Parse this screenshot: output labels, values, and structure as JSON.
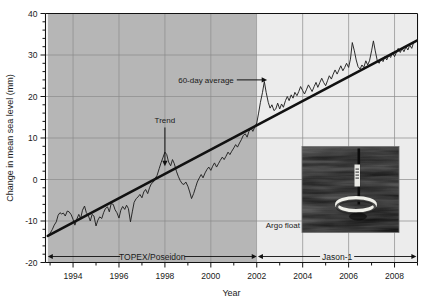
{
  "chart_data": {
    "type": "line",
    "title": "",
    "xlabel": "Year",
    "ylabel": "Change in mean sea level (mm)",
    "xlim": [
      1992.8,
      2009.0
    ],
    "ylim": [
      -20,
      40
    ],
    "xticks": [
      1994,
      1996,
      1998,
      2000,
      2002,
      2004,
      2006,
      2008
    ],
    "xticklabels": [
      "1994",
      "1996",
      "1998",
      "2000",
      "2002",
      "2004",
      "2006",
      "2008"
    ],
    "yticks": [
      -20,
      -10,
      0,
      10,
      20,
      30,
      40
    ],
    "yticklabels": [
      "-20",
      "-10",
      "0",
      "10",
      "20",
      "30",
      "40"
    ],
    "minor_xtick_interval": 1,
    "minor_ytick_interval": 2,
    "grid": true,
    "legend": "none",
    "annotations": [
      {
        "name": "sixty-day-average",
        "text": "60-day average",
        "x": 2001.0,
        "y": 24.0
      },
      {
        "name": "trend",
        "text": "Trend",
        "x": 1998.0,
        "y": 13.5
      },
      {
        "name": "argo-float",
        "text": "Argo float",
        "x": 2003.2,
        "y": -11.0
      }
    ],
    "period_bands": [
      {
        "name": "topex-poseidon",
        "label": "TOPEX/Poseidon",
        "start": 1992.9,
        "end": 2002.0,
        "shade": "#b6b6b6"
      },
      {
        "name": "jason-1",
        "label": "Jason-1",
        "start": 2002.05,
        "end": 2008.95,
        "shade": "#ececec"
      }
    ],
    "trend_line": {
      "name": "linear-trend",
      "points": [
        [
          1992.9,
          -13.6
        ],
        [
          2008.95,
          33.4
        ]
      ],
      "slope_mm_per_year": 2.93,
      "color": "#111111"
    },
    "series": [
      {
        "name": "60-day average sea level",
        "color": "#222222",
        "x": [
          1992.9,
          1993.0,
          1993.1,
          1993.18,
          1993.27,
          1993.35,
          1993.43,
          1993.5,
          1993.58,
          1993.66,
          1993.75,
          1993.83,
          1993.92,
          1994.0,
          1994.08,
          1994.16,
          1994.25,
          1994.33,
          1994.41,
          1994.5,
          1994.58,
          1994.66,
          1994.75,
          1994.83,
          1994.91,
          1995.0,
          1995.08,
          1995.16,
          1995.25,
          1995.33,
          1995.41,
          1995.5,
          1995.58,
          1995.66,
          1995.75,
          1995.83,
          1995.91,
          1996.0,
          1996.08,
          1996.16,
          1996.25,
          1996.33,
          1996.41,
          1996.5,
          1996.58,
          1996.66,
          1996.75,
          1996.83,
          1996.91,
          1997.0,
          1997.08,
          1997.16,
          1997.25,
          1997.33,
          1997.41,
          1997.5,
          1997.58,
          1997.66,
          1997.75,
          1997.83,
          1997.91,
          1998.0,
          1998.08,
          1998.16,
          1998.25,
          1998.33,
          1998.41,
          1998.5,
          1998.58,
          1998.66,
          1998.75,
          1998.83,
          1998.91,
          1999.0,
          1999.08,
          1999.16,
          1999.25,
          1999.33,
          1999.41,
          1999.5,
          1999.58,
          1999.66,
          1999.75,
          1999.83,
          1999.91,
          2000.0,
          2000.08,
          2000.16,
          2000.25,
          2000.33,
          2000.41,
          2000.5,
          2000.58,
          2000.66,
          2000.75,
          2000.83,
          2000.91,
          2001.0,
          2001.08,
          2001.16,
          2001.25,
          2001.33,
          2001.41,
          2001.5,
          2001.58,
          2001.66,
          2001.75,
          2001.83,
          2001.91,
          2002.0,
          2002.08,
          2002.16,
          2002.25,
          2002.33,
          2002.41,
          2002.5,
          2002.58,
          2002.66,
          2002.75,
          2002.83,
          2002.91,
          2003.0,
          2003.08,
          2003.16,
          2003.25,
          2003.33,
          2003.41,
          2003.5,
          2003.58,
          2003.66,
          2003.75,
          2003.83,
          2003.91,
          2004.0,
          2004.08,
          2004.16,
          2004.25,
          2004.33,
          2004.41,
          2004.5,
          2004.58,
          2004.66,
          2004.75,
          2004.83,
          2004.91,
          2005.0,
          2005.08,
          2005.16,
          2005.25,
          2005.33,
          2005.41,
          2005.5,
          2005.58,
          2005.66,
          2005.75,
          2005.83,
          2005.91,
          2006.0,
          2006.08,
          2006.16,
          2006.25,
          2006.33,
          2006.41,
          2006.5,
          2006.58,
          2006.66,
          2006.75,
          2006.83,
          2006.91,
          2007.0,
          2007.08,
          2007.16,
          2007.25,
          2007.33,
          2007.41,
          2007.5,
          2007.58,
          2007.66,
          2007.75,
          2007.83,
          2007.91,
          2008.0,
          2008.08,
          2008.16,
          2008.25,
          2008.33,
          2008.41,
          2008.5,
          2008.58,
          2008.66,
          2008.75,
          2008.83,
          2008.95
        ],
        "y": [
          -13.5,
          -13.0,
          -12.0,
          -11.0,
          -10.2,
          -8.6,
          -8.0,
          -8.3,
          -8.1,
          -8.8,
          -7.6,
          -7.8,
          -8.5,
          -9.6,
          -11.0,
          -9.6,
          -8.4,
          -9.4,
          -7.4,
          -6.4,
          -8.0,
          -8.6,
          -10.0,
          -8.4,
          -8.8,
          -11.2,
          -9.8,
          -9.0,
          -9.4,
          -8.0,
          -7.0,
          -6.6,
          -7.8,
          -5.8,
          -6.0,
          -7.3,
          -8.0,
          -9.3,
          -7.4,
          -6.5,
          -7.2,
          -6.2,
          -7.0,
          -10.2,
          -7.8,
          -5.5,
          -4.6,
          -4.2,
          -3.6,
          -4.4,
          -3.0,
          -2.4,
          -3.4,
          -2.0,
          -1.0,
          -0.6,
          0.3,
          1.0,
          2.6,
          4.0,
          5.2,
          6.6,
          6.0,
          4.2,
          3.3,
          4.8,
          3.8,
          2.0,
          0.8,
          -0.2,
          -1.0,
          -1.2,
          -0.6,
          -1.6,
          -3.0,
          -4.6,
          -3.4,
          -2.0,
          -0.6,
          0.4,
          1.2,
          0.4,
          1.6,
          2.4,
          3.0,
          2.2,
          3.2,
          4.0,
          3.0,
          3.8,
          4.6,
          5.4,
          4.8,
          5.6,
          6.6,
          6.0,
          6.8,
          7.6,
          8.4,
          7.8,
          8.8,
          9.6,
          10.6,
          11.0,
          10.2,
          11.6,
          12.4,
          11.6,
          12.6,
          13.6,
          16.0,
          18.6,
          21.0,
          23.6,
          21.0,
          18.6,
          17.2,
          18.0,
          16.6,
          17.0,
          18.4,
          17.0,
          18.2,
          17.4,
          19.0,
          20.0,
          19.0,
          20.4,
          19.6,
          21.0,
          20.2,
          21.2,
          22.4,
          21.4,
          20.6,
          21.6,
          22.8,
          22.0,
          21.2,
          22.4,
          23.4,
          22.2,
          23.4,
          24.4,
          23.4,
          22.6,
          23.8,
          25.0,
          24.2,
          25.4,
          26.4,
          25.4,
          26.4,
          27.4,
          26.2,
          27.0,
          28.0,
          27.0,
          29.0,
          33.0,
          31.0,
          28.8,
          27.2,
          26.6,
          27.6,
          27.0,
          28.6,
          27.6,
          28.6,
          31.0,
          33.4,
          31.0,
          28.6,
          28.0,
          29.0,
          28.4,
          29.6,
          28.8,
          30.0,
          29.4,
          30.6,
          29.6,
          30.6,
          31.6,
          30.6,
          31.6,
          30.8,
          32.0,
          31.2,
          32.4,
          31.6,
          33.0,
          33.6
        ]
      }
    ]
  },
  "inset_photo": {
    "name": "argo-float-photo",
    "caption": "Argo float",
    "alt": "Argo profiling float bobbing in dark ocean water"
  }
}
